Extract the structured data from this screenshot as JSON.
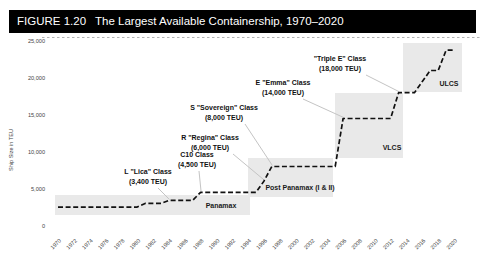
{
  "figure": {
    "label": "FIGURE 1.20",
    "title": "The Largest Available Containership, 1970–2020"
  },
  "chart_data": {
    "type": "line",
    "subtype": "step",
    "title": "The Largest Available Containership, 1970–2020",
    "xlabel": "",
    "ylabel": "Ship Size in TEU",
    "xlim": [
      1970,
      2020
    ],
    "ylim": [
      0,
      26000
    ],
    "grid": false,
    "legend": null,
    "line": {
      "color": "#111111",
      "style": "dashed"
    },
    "x_ticks": [
      1970,
      1972,
      1974,
      1976,
      1978,
      1980,
      1982,
      1984,
      1986,
      1988,
      1990,
      1992,
      1994,
      1996,
      1998,
      2000,
      2002,
      2004,
      2006,
      2008,
      2010,
      2012,
      2014,
      2016,
      2018,
      2020
    ],
    "y_ticks": [
      {
        "label": "0",
        "value": 0
      },
      {
        "label": "5,000",
        "value": 5000
      },
      {
        "label": "10,000",
        "value": 10000
      },
      {
        "label": "15,000",
        "value": 15000
      },
      {
        "label": "20,000",
        "value": 20000
      },
      {
        "label": "25,000",
        "value": 25000
      }
    ],
    "steps": [
      {
        "year": 1970,
        "teu": 2500
      },
      {
        "year": 1981,
        "teu": 3000
      },
      {
        "year": 1984,
        "teu": 3400
      },
      {
        "year": 1988,
        "teu": 4500
      },
      {
        "year": 1996,
        "teu": 6000
      },
      {
        "year": 1997,
        "teu": 8000
      },
      {
        "year": 2006,
        "teu": 14500
      },
      {
        "year": 2013,
        "teu": 18000
      },
      {
        "year": 2016,
        "teu": 19500
      },
      {
        "year": 2017,
        "teu": 21000
      },
      {
        "year": 2019,
        "teu": 23756
      }
    ],
    "annotations": [
      {
        "id": "lica",
        "line1": "L \"Lica\" Class",
        "line2": "(3,400 TEU)",
        "points_to": {
          "year": 1984,
          "teu": 3400
        }
      },
      {
        "id": "c10",
        "line1": "C10 Class",
        "line2": "(4,500 TEU)",
        "points_to": {
          "year": 1988,
          "teu": 4500
        }
      },
      {
        "id": "regina",
        "line1": "R \"Regina\" Class",
        "line2": "(6,000 TEU)",
        "points_to": {
          "year": 1996,
          "teu": 6000
        }
      },
      {
        "id": "sovereign",
        "line1": "S \"Sovereign\" Class",
        "line2": "(8,000 TEU)",
        "points_to": {
          "year": 1997,
          "teu": 8000
        }
      },
      {
        "id": "emma",
        "line1": "E \"Emma\" Class",
        "line2": "(14,000 TEU)",
        "points_to": {
          "year": 2006,
          "teu": 14500
        }
      },
      {
        "id": "triple_e",
        "line1": "\"Triple E\" Class",
        "line2": "(18,000 TEU)",
        "points_to": {
          "year": 2013,
          "teu": 18000
        }
      }
    ],
    "regions": [
      {
        "id": "panamax",
        "label": "Panamax",
        "year_range": [
          1970,
          1994
        ],
        "teu_max": 4000
      },
      {
        "id": "post_panamax",
        "label": "Post Panamax (I & II)",
        "year_range": [
          1994,
          2005
        ],
        "teu_max": 9000
      },
      {
        "id": "vlcs",
        "label": "VLCS",
        "year_range": [
          2005,
          2013
        ],
        "teu_max": 18000
      },
      {
        "id": "ulcs",
        "label": "ULCS",
        "year_range": [
          2013,
          2020
        ],
        "teu_max": 24800
      }
    ],
    "colors": {
      "region_fill": "#e9e9e9",
      "leader": "#c4c4c4",
      "line": "#111111",
      "tick_text": "#444444"
    }
  }
}
